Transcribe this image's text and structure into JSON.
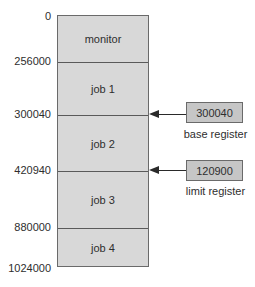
{
  "diagram": {
    "title": "",
    "addresses": [
      {
        "value": "0",
        "y": 10
      },
      {
        "value": "256000",
        "y": 55
      },
      {
        "value": "300040",
        "y": 108
      },
      {
        "value": "420940",
        "y": 164
      },
      {
        "value": "880000",
        "y": 221
      },
      {
        "value": "1024000",
        "y": 262
      }
    ],
    "segments": [
      {
        "label": "monitor",
        "top": 0,
        "height": 46
      },
      {
        "label": "job 1",
        "top": 46,
        "height": 53
      },
      {
        "label": "job 2",
        "top": 99,
        "height": 56
      },
      {
        "label": "job 3",
        "top": 155,
        "height": 57
      },
      {
        "label": "job 4",
        "top": 212,
        "height": 39
      }
    ],
    "registers": {
      "base": {
        "value": "300040",
        "caption": "base register"
      },
      "limit": {
        "value": "120900",
        "caption": "limit register"
      }
    },
    "colors": {
      "memory_fill": "#d8d8d8",
      "register_fill": "#c6c6c6",
      "border": "#6a6a6a",
      "text": "#2e2e2e"
    }
  }
}
